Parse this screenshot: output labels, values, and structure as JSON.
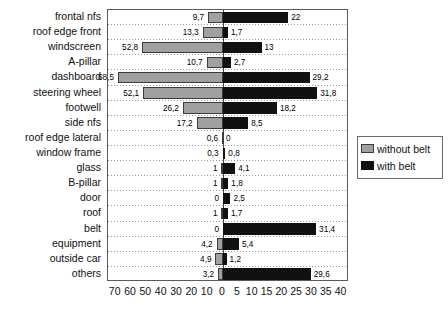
{
  "chart_data": {
    "type": "bar",
    "orientation": "horizontal",
    "layout": "diverging-bidirectional",
    "title": "",
    "subtitle": "",
    "xlabel": "",
    "ylabel": "",
    "grid": "horizontal-dotted-row-separators",
    "legend_position": "right",
    "categories": [
      "frontal nfs",
      "roof edge front",
      "windscreen",
      "A-pillar",
      "dashboard",
      "steering wheel",
      "footwell",
      "side nfs",
      "roof edge lateral",
      "window frame",
      "glass",
      "B-pillar",
      "door",
      "roof",
      "belt",
      "equipment",
      "outside car",
      "others"
    ],
    "series": [
      {
        "name": "without belt",
        "side": "left",
        "color": "#a0a0a0",
        "values": [
          9.7,
          13.3,
          52.8,
          10.7,
          68.5,
          52.1,
          26.2,
          17.2,
          0.6,
          0.3,
          1,
          1,
          0,
          1,
          0,
          4.2,
          4.9,
          3.2
        ],
        "labels": [
          "9,7",
          "13,3",
          "52,8",
          "10,7",
          "68,5",
          "52,1",
          "26,2",
          "17,2",
          "0,6",
          "0,3",
          "1",
          "1",
          "0",
          "1",
          "0",
          "4,2",
          "4,9",
          "3,2"
        ]
      },
      {
        "name": "with belt",
        "side": "right",
        "color": "#111111",
        "values": [
          22,
          1.7,
          13,
          2.7,
          29.2,
          31.8,
          18.2,
          8.5,
          0,
          0.8,
          4.1,
          1.8,
          2.5,
          1.7,
          31.4,
          5.4,
          1.2,
          29.6
        ],
        "labels": [
          "22",
          "1,7",
          "13",
          "2,7",
          "29,2",
          "31,8",
          "18,2",
          "8,5",
          "0",
          "0,8",
          "4,1",
          "1,8",
          "2,5",
          "1,7",
          "31,4",
          "5,4",
          "1,2",
          "29,6"
        ]
      }
    ],
    "xaxis": {
      "left_ticks": [
        70,
        60,
        50,
        40,
        30,
        20,
        10
      ],
      "left_tick_labels": [
        "70",
        "60",
        "50",
        "40",
        "30",
        "20",
        "10"
      ],
      "zero_tick_label": "0",
      "right_ticks": [
        5,
        10,
        15,
        20,
        25,
        30,
        35,
        40
      ],
      "right_tick_labels": [
        "5",
        "10",
        "15",
        "20",
        "25",
        "30",
        "35",
        "40"
      ],
      "left_max": 75,
      "right_max": 42.5
    }
  },
  "legend": {
    "items": [
      {
        "label": "without belt",
        "color": "#a0a0a0"
      },
      {
        "label": "with belt",
        "color": "#111111"
      }
    ]
  }
}
